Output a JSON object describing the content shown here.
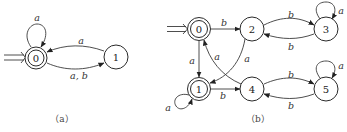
{
  "figures": [
    {
      "id": "a",
      "caption": "（a）",
      "start_state": "0",
      "states": [
        {
          "id": "0",
          "label": "0",
          "accepting": true
        },
        {
          "id": "1",
          "label": "1",
          "accepting": false
        }
      ],
      "transitions": [
        {
          "from": "0",
          "to": "0",
          "label": "a"
        },
        {
          "from": "1",
          "to": "0",
          "label": "a"
        },
        {
          "from": "0",
          "to": "1",
          "label": "a, b"
        }
      ]
    },
    {
      "id": "b",
      "caption": "（b）",
      "start_state": "0",
      "states": [
        {
          "id": "0",
          "label": "0",
          "accepting": true
        },
        {
          "id": "1",
          "label": "1",
          "accepting": true
        },
        {
          "id": "2",
          "label": "2",
          "accepting": false
        },
        {
          "id": "3",
          "label": "3",
          "accepting": false
        },
        {
          "id": "4",
          "label": "4",
          "accepting": false
        },
        {
          "id": "5",
          "label": "5",
          "accepting": false
        }
      ],
      "transitions": [
        {
          "from": "0",
          "to": "2",
          "label": "b"
        },
        {
          "from": "0",
          "to": "1",
          "label": "a"
        },
        {
          "from": "2",
          "to": "3",
          "label": "b"
        },
        {
          "from": "3",
          "to": "2",
          "label": "b"
        },
        {
          "from": "3",
          "to": "3",
          "label": "a"
        },
        {
          "from": "2",
          "to": "1",
          "label": "a"
        },
        {
          "from": "4",
          "to": "0",
          "label": "a"
        },
        {
          "from": "1",
          "to": "1",
          "label": "a"
        },
        {
          "from": "1",
          "to": "4",
          "label": "b"
        },
        {
          "from": "4",
          "to": "5",
          "label": "b"
        },
        {
          "from": "5",
          "to": "4",
          "label": "b"
        },
        {
          "from": "5",
          "to": "5",
          "label": "a"
        }
      ]
    }
  ]
}
